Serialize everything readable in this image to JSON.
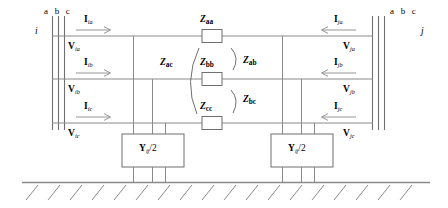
{
  "figure": {
    "type": "three-phase-transmission-line-pi-model",
    "background_color": "#ffffff",
    "line_color": "#808080",
    "text_color": "#000000"
  },
  "buses": {
    "left": {
      "name": "i",
      "phase_header": "a b c",
      "phases": [
        "a",
        "b",
        "c"
      ]
    },
    "right": {
      "name": "j",
      "phase_header": "a b c",
      "phases": [
        "a",
        "b",
        "c"
      ]
    }
  },
  "currents": {
    "left": [
      {
        "symbol": "I",
        "subscript": "ia",
        "direction": "right"
      },
      {
        "symbol": "I",
        "subscript": "ib",
        "direction": "right"
      },
      {
        "symbol": "I",
        "subscript": "ic",
        "direction": "right"
      }
    ],
    "right": [
      {
        "symbol": "I",
        "subscript": "ja",
        "direction": "left"
      },
      {
        "symbol": "I",
        "subscript": "jb",
        "direction": "left"
      },
      {
        "symbol": "I",
        "subscript": "jc",
        "direction": "left"
      }
    ]
  },
  "voltages": {
    "left": [
      {
        "symbol": "V",
        "subscript": "ia"
      },
      {
        "symbol": "V",
        "subscript": "ib"
      },
      {
        "symbol": "V",
        "subscript": "ic"
      }
    ],
    "right": [
      {
        "symbol": "V",
        "subscript": "ja"
      },
      {
        "symbol": "V",
        "subscript": "jb"
      },
      {
        "symbol": "V",
        "subscript": "jc"
      }
    ]
  },
  "series_impedances": [
    {
      "symbol": "Z",
      "subscript": "aa",
      "phase": "a"
    },
    {
      "symbol": "Z",
      "subscript": "bb",
      "phase": "b"
    },
    {
      "symbol": "Z",
      "subscript": "cc",
      "phase": "c"
    }
  ],
  "mutual_impedances": [
    {
      "symbol": "Z",
      "subscript": "ab",
      "between": [
        "a",
        "b"
      ]
    },
    {
      "symbol": "Z",
      "subscript": "ac",
      "between": [
        "a",
        "c"
      ]
    },
    {
      "symbol": "Z",
      "subscript": "bc",
      "between": [
        "b",
        "c"
      ]
    }
  ],
  "shunt_admittances": [
    {
      "symbol": "Y",
      "subscript": "ij",
      "divisor": "/2",
      "side": "left"
    },
    {
      "symbol": "Y",
      "subscript": "ij",
      "divisor": "/2",
      "side": "right"
    }
  ],
  "ground": {
    "label": "earth-hatching",
    "hatch_count": 18
  }
}
